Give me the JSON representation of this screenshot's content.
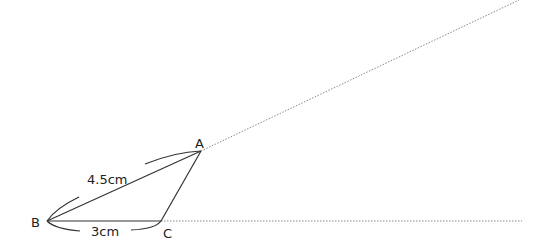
{
  "diagram": {
    "type": "geometric-construction",
    "points": {
      "A": {
        "label": "A",
        "x": 201,
        "y": 151
      },
      "B": {
        "label": "B",
        "x": 47,
        "y": 221
      },
      "C": {
        "label": "C",
        "x": 161,
        "y": 221
      }
    },
    "measurements": {
      "AB": "4.5cm",
      "BC": "3cm"
    },
    "colors": {
      "line": "#333333",
      "dotted": "#888888",
      "text": "#222222"
    }
  }
}
